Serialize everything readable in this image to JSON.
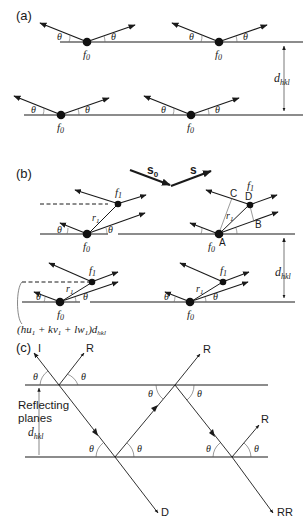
{
  "panels": {
    "a": {
      "label": "(a)",
      "theta": "θ",
      "atom": "f",
      "atom_sub": "0",
      "spacing": "d",
      "spacing_sub": "hkl"
    },
    "b": {
      "label": "(b)",
      "theta": "θ",
      "atom0": "f",
      "atom0_sub": "0",
      "atom1": "f",
      "atom1_sub": "1",
      "vector_r": "r",
      "vector_r_sub": "1",
      "incident_vector": "s",
      "incident_vector_sub": "0",
      "scattered_vector": "s",
      "point_a": "A",
      "point_b": "B",
      "point_c": "C",
      "point_d": "D",
      "spacing": "d",
      "spacing_sub": "hkl",
      "formula_open": "(hu",
      "formula_sub1": "1",
      "formula_mid1": " + kv",
      "formula_sub2": "1",
      "formula_mid2": " + lw",
      "formula_sub3": "1",
      "formula_close": ")d",
      "formula_sub4": "hkl"
    },
    "c": {
      "label": "(c)",
      "theta": "θ",
      "incident": "I",
      "reflected": "R",
      "diffracted": "D",
      "double_reflected": "RR",
      "planes_label_1": "Reflecting",
      "planes_label_2": "planes",
      "spacing": "d",
      "spacing_sub": "hkl"
    }
  }
}
